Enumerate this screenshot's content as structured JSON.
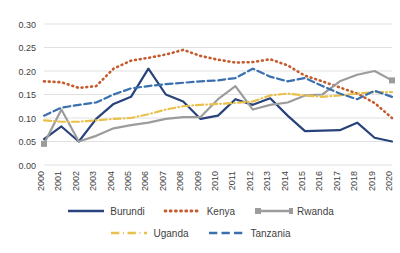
{
  "chart_data": {
    "type": "line",
    "title": "",
    "subtitle": "",
    "xlabel": "",
    "ylabel": "",
    "grid": "horizontal",
    "legend_position": "bottom",
    "ylim": [
      0.0,
      0.3
    ],
    "ytick_labels": [
      "0.00",
      "0.05",
      "0.10",
      "0.15",
      "0.20",
      "0.25",
      "0.30"
    ],
    "ytick_values": [
      0.0,
      0.05,
      0.1,
      0.15,
      0.2,
      0.25,
      0.3
    ],
    "categories": [
      "2000",
      "2001",
      "2002",
      "2003",
      "2004",
      "2005",
      "2006",
      "2007",
      "2008",
      "2009",
      "2010",
      "2011",
      "2012",
      "2013",
      "2014",
      "2015",
      "2016",
      "2017",
      "2018",
      "2019",
      "2020"
    ],
    "series": [
      {
        "name": "Burundi",
        "color": "#28427B",
        "style": "solid",
        "marker": "none",
        "values": [
          0.055,
          0.082,
          0.05,
          0.098,
          0.13,
          0.145,
          0.205,
          0.15,
          0.135,
          0.098,
          0.105,
          0.14,
          0.128,
          0.142,
          0.105,
          0.072,
          0.073,
          0.074,
          0.09,
          0.058,
          0.05
        ]
      },
      {
        "name": "Kenya",
        "color": "#C55A2D",
        "style": "dotted",
        "marker": "none",
        "values": [
          0.178,
          0.176,
          0.164,
          0.168,
          0.205,
          0.222,
          0.228,
          0.235,
          0.245,
          0.232,
          0.224,
          0.218,
          0.219,
          0.225,
          0.212,
          0.19,
          0.178,
          0.165,
          0.152,
          0.132,
          0.1
        ]
      },
      {
        "name": "Rwanda",
        "color": "#9C9C9C",
        "style": "solid",
        "marker": "square",
        "values": [
          0.045,
          0.118,
          0.05,
          0.062,
          0.078,
          0.085,
          0.09,
          0.098,
          0.102,
          0.102,
          0.14,
          0.168,
          0.118,
          0.128,
          0.133,
          0.148,
          0.15,
          0.178,
          0.192,
          0.2,
          0.18
        ]
      },
      {
        "name": "Uganda",
        "color": "#E8C04A",
        "style": "dashdot",
        "marker": "none",
        "values": [
          0.095,
          0.092,
          0.092,
          0.095,
          0.098,
          0.1,
          0.108,
          0.118,
          0.125,
          0.128,
          0.13,
          0.132,
          0.135,
          0.148,
          0.152,
          0.148,
          0.145,
          0.148,
          0.152,
          0.155,
          0.155
        ]
      },
      {
        "name": "Tanzania",
        "color": "#3A6FB0",
        "style": "dashed",
        "marker": "none",
        "values": [
          0.105,
          0.122,
          0.128,
          0.133,
          0.15,
          0.163,
          0.168,
          0.172,
          0.175,
          0.178,
          0.18,
          0.185,
          0.205,
          0.188,
          0.178,
          0.185,
          0.168,
          0.152,
          0.14,
          0.158,
          0.145
        ]
      }
    ]
  },
  "legend": {
    "row1": [
      {
        "label": "Burundi",
        "key": "legend-item-burundi"
      },
      {
        "label": "Kenya",
        "key": "legend-item-kenya"
      },
      {
        "label": "Rwanda",
        "key": "legend-item-rwanda"
      }
    ],
    "row2": [
      {
        "label": "Uganda",
        "key": "legend-item-uganda"
      },
      {
        "label": "Tanzania",
        "key": "legend-item-tanzania"
      }
    ]
  }
}
